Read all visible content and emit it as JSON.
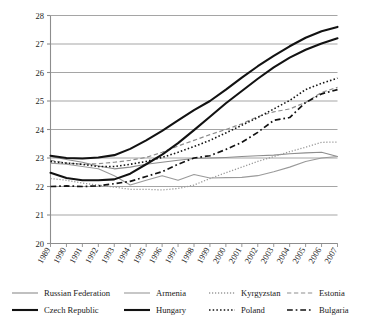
{
  "chart_data": {
    "type": "line",
    "title": "",
    "subtitle": "",
    "xlabel": "",
    "ylabel": "",
    "xlim": [
      1989,
      2007
    ],
    "ylim": [
      20,
      28
    ],
    "ytick_values": [
      20,
      21,
      22,
      23,
      24,
      25,
      26,
      27,
      28
    ],
    "ytick_labels": [
      "20",
      "21",
      "22",
      "23",
      "24",
      "25",
      "26",
      "27",
      "28"
    ],
    "grid": "horizontal",
    "legend_position": "bottom",
    "x": [
      1989,
      1990,
      1991,
      1992,
      1993,
      1994,
      1995,
      1996,
      1997,
      1998,
      1999,
      2000,
      2001,
      2002,
      2003,
      2004,
      2005,
      2006,
      2007
    ],
    "xtick_labels": [
      "1989",
      "1990",
      "1991",
      "1992",
      "1993",
      "1994",
      "1995",
      "1996",
      "1997",
      "1998",
      "1999",
      "2000",
      "2001",
      "2002",
      "2003",
      "2004",
      "2005",
      "2006",
      "2007"
    ],
    "series": [
      {
        "name": "Russian Federation",
        "style": "solid",
        "color": "#8d8d8d",
        "width": 1.1,
        "values": [
          23.05,
          22.95,
          22.85,
          22.72,
          22.62,
          22.68,
          22.78,
          22.85,
          22.92,
          22.98,
          23.0,
          23.02,
          23.05,
          23.08,
          23.1,
          23.15,
          23.18,
          23.2,
          23.05
        ]
      },
      {
        "name": "Armenia",
        "style": "solid",
        "color": "#9a9a9a",
        "width": 1.1,
        "values": [
          22.82,
          22.78,
          22.7,
          22.62,
          22.38,
          22.05,
          22.22,
          22.38,
          22.22,
          22.42,
          22.3,
          22.31,
          22.32,
          22.38,
          22.52,
          22.68,
          22.88,
          23.0,
          23.05
        ]
      },
      {
        "name": "Kyrgyzstan",
        "style": "dotted",
        "color": "#9a9a9a",
        "width": 1.3,
        "values": [
          22.28,
          22.22,
          22.12,
          22.05,
          21.98,
          21.9,
          21.9,
          21.88,
          21.93,
          22.05,
          22.28,
          22.48,
          22.68,
          22.88,
          23.05,
          23.22,
          23.38,
          23.55,
          23.56
        ]
      },
      {
        "name": "Estonia",
        "style": "dashed",
        "color": "#8d8d8d",
        "width": 1.2,
        "values": [
          22.92,
          22.82,
          22.78,
          22.8,
          22.85,
          22.92,
          23.02,
          23.2,
          23.42,
          23.62,
          23.82,
          24.0,
          24.2,
          24.45,
          24.62,
          24.72,
          24.95,
          25.3,
          25.48
        ]
      },
      {
        "name": "Czech Republic",
        "style": "solid",
        "color": "#121212",
        "width": 2.1,
        "values": [
          23.08,
          23.0,
          22.98,
          23.02,
          23.1,
          23.32,
          23.62,
          23.95,
          24.32,
          24.68,
          25.0,
          25.4,
          25.82,
          26.22,
          26.58,
          26.92,
          27.22,
          27.45,
          27.6
        ]
      },
      {
        "name": "Hungary",
        "style": "solid",
        "color": "#121212",
        "width": 2.1,
        "values": [
          22.48,
          22.3,
          22.22,
          22.22,
          22.25,
          22.45,
          22.78,
          23.12,
          23.52,
          23.98,
          24.45,
          24.92,
          25.35,
          25.78,
          26.18,
          26.52,
          26.8,
          27.02,
          27.2
        ]
      },
      {
        "name": "Poland",
        "style": "dotted",
        "color": "#121212",
        "width": 1.6,
        "values": [
          22.88,
          22.82,
          22.78,
          22.7,
          22.7,
          22.78,
          22.88,
          23.02,
          23.2,
          23.4,
          23.62,
          23.88,
          24.15,
          24.42,
          24.72,
          25.02,
          25.4,
          25.62,
          25.8
        ]
      },
      {
        "name": "Bulgaria",
        "style": "dashdot",
        "color": "#121212",
        "width": 1.7,
        "values": [
          22.0,
          22.02,
          22.0,
          22.02,
          22.1,
          22.18,
          22.35,
          22.52,
          22.78,
          23.0,
          23.08,
          23.3,
          23.55,
          23.9,
          24.32,
          24.42,
          24.95,
          25.25,
          25.4
        ]
      }
    ]
  },
  "legend": {
    "rows": [
      [
        {
          "label": "Russian Federation",
          "series": 0
        },
        {
          "label": "Armenia",
          "series": 1
        },
        {
          "label": "Kyrgyzstan",
          "series": 2
        },
        {
          "label": "Estonia",
          "series": 3
        }
      ],
      [
        {
          "label": "Czech Republic",
          "series": 4
        },
        {
          "label": "Hungary",
          "series": 5
        },
        {
          "label": "Poland",
          "series": 6
        },
        {
          "label": "Bulgaria",
          "series": 7
        }
      ]
    ]
  },
  "axis": {
    "axis_color": "#8d8d8d",
    "grid_color": "#9b9b9b",
    "text_color": "#1a1a1a"
  }
}
